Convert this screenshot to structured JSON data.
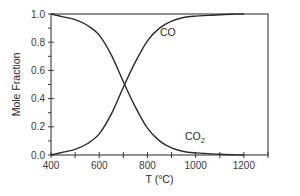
{
  "chart_data": {
    "type": "line",
    "title": "",
    "xlabel": "T (°C)",
    "ylabel": "Mole Fraction",
    "xlim": [
      400,
      1300
    ],
    "ylim": [
      0.0,
      1.0
    ],
    "grid": false,
    "legend": "inline labels",
    "xticks": [
      400,
      600,
      800,
      1000,
      1200
    ],
    "xtick_labels": [
      "400",
      "600",
      "800",
      "1000",
      "1200"
    ],
    "xminor_ticks": [
      500,
      700,
      900,
      1100,
      1300
    ],
    "yticks": [
      0.0,
      0.2,
      0.4,
      0.6,
      0.8,
      1.0
    ],
    "ytick_labels": [
      "0.0",
      "0.2",
      "0.4",
      "0.6",
      "0.8",
      "1.0"
    ],
    "yminor_ticks": [
      0.1,
      0.3,
      0.5,
      0.7,
      0.9
    ],
    "x": [
      400,
      450,
      500,
      550,
      600,
      650,
      700,
      750,
      800,
      850,
      900,
      950,
      1000,
      1050,
      1100,
      1150,
      1200
    ],
    "series": [
      {
        "name": "CO",
        "label": "CO",
        "values": [
          0.0,
          0.02,
          0.04,
          0.08,
          0.15,
          0.29,
          0.48,
          0.66,
          0.81,
          0.9,
          0.95,
          0.975,
          0.985,
          0.99,
          0.995,
          0.998,
          1.0
        ],
        "color": "#2a2a2a"
      },
      {
        "name": "CO2",
        "label": "CO",
        "label_subscript": "2",
        "values": [
          1.0,
          0.98,
          0.96,
          0.92,
          0.85,
          0.71,
          0.52,
          0.34,
          0.19,
          0.1,
          0.05,
          0.025,
          0.015,
          0.01,
          0.005,
          0.002,
          0.0
        ],
        "color": "#2a2a2a"
      }
    ],
    "annotations": [
      {
        "text": "CO",
        "x": 1000,
        "y": 0.84
      },
      {
        "text": "CO2",
        "x": 1000,
        "y": 0.13
      }
    ]
  }
}
